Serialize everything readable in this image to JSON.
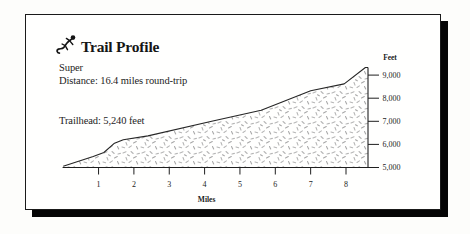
{
  "card": {
    "background": "#fffffe",
    "border_color": "#1a1a1a",
    "shadow_color": "#050505"
  },
  "header": {
    "icon": "lizard-icon",
    "title": "Trail Profile",
    "trail_name": "Super",
    "distance_line": "Distance: 16.4 miles round-trip",
    "trailhead_line": "Trailhead: 5,240 feet"
  },
  "chart_data": {
    "type": "area",
    "title": "Trail Profile",
    "subtitle": "Super",
    "xlabel": "Miles",
    "ylabel": "Feet",
    "x_ticks": [
      "1",
      "2",
      "3",
      "4",
      "5",
      "6",
      "7",
      "8"
    ],
    "y_ticks": [
      {
        "value": 5000,
        "label": "5,000"
      },
      {
        "value": 6000,
        "label": "6,000"
      },
      {
        "value": 7000,
        "label": "7,000"
      },
      {
        "value": 8000,
        "label": "8,000"
      },
      {
        "value": 9000,
        "label": "9,000"
      }
    ],
    "xlim": [
      0,
      8.65
    ],
    "ylim": [
      5000,
      9450
    ],
    "grid": false,
    "legend": false,
    "round_trip_miles": 16.4,
    "trailhead_feet": 5240,
    "elevation_profile": [
      {
        "mile": 0.0,
        "feet": 5050
      },
      {
        "mile": 0.85,
        "feet": 5480
      },
      {
        "mile": 1.15,
        "feet": 5650
      },
      {
        "mile": 1.45,
        "feet": 6050
      },
      {
        "mile": 1.7,
        "feet": 6200
      },
      {
        "mile": 2.4,
        "feet": 6370
      },
      {
        "mile": 4.2,
        "feet": 7000
      },
      {
        "mile": 5.6,
        "feet": 7480
      },
      {
        "mile": 7.0,
        "feet": 8320
      },
      {
        "mile": 7.95,
        "feet": 8620
      },
      {
        "mile": 8.55,
        "feet": 9330
      }
    ],
    "fill_style": "stipple",
    "stipple_colors": [
      "#b6b6b6",
      "#a8a8a8"
    ],
    "line_color": "#262626",
    "axis_color": "#1f1f1f"
  }
}
